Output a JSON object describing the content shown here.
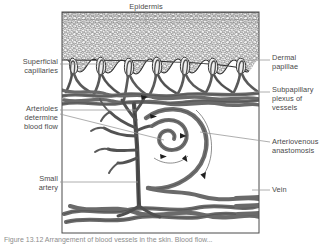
{
  "figure": {
    "title_label": "Epidermis",
    "frame": {
      "x": 62,
      "y": 12,
      "width": 197,
      "height": 221
    },
    "caption": "Figure 13.12  Arrangement of blood vessels in the skin. Blood flow..."
  },
  "labels": [
    {
      "id": "epidermis",
      "text": "Epidermis",
      "side": "top",
      "x": 108,
      "y": 2,
      "width": 76,
      "align": "center"
    },
    {
      "id": "superficial-capillaries",
      "text": "Superficial\ncapillaries",
      "side": "left",
      "x": 2,
      "y": 57,
      "width": 56,
      "align": "right"
    },
    {
      "id": "arterioles-determine-blood-flow",
      "text": "Arterioles\ndetermine\nblood flow",
      "side": "left",
      "x": 2,
      "y": 104,
      "width": 56,
      "align": "right"
    },
    {
      "id": "small-artery",
      "text": "Small\nartery",
      "side": "left",
      "x": 2,
      "y": 174,
      "width": 56,
      "align": "right"
    },
    {
      "id": "dermal-papillae",
      "text": "Dermal\npapillae",
      "side": "right",
      "x": 272,
      "y": 53,
      "width": 58,
      "align": "left"
    },
    {
      "id": "subpapillary-plexus-of-vessels",
      "text": "Subpapillary\nplexus of\nvessels",
      "side": "right",
      "x": 272,
      "y": 85,
      "width": 58,
      "align": "left"
    },
    {
      "id": "arteriovenous-anastomosis",
      "text": "Arteriovenous\nanastomosis",
      "side": "right",
      "x": 272,
      "y": 137,
      "width": 58,
      "align": "left"
    },
    {
      "id": "vein",
      "text": "Vein",
      "side": "right",
      "x": 272,
      "y": 185,
      "width": 58,
      "align": "left"
    }
  ],
  "colors": {
    "vessel_dark": "#6b6b6b",
    "vessel_outline": "#2e2e2e",
    "leader_line": "#9a9a9a",
    "frame": "#4a4a4a",
    "epidermis_fill": "#f2f2f2",
    "text": "#4a4a4a",
    "caption_text": "#8d8d8d"
  },
  "structures": {
    "epidermis_layer": "stippled-cellular-texture",
    "dermal_papillae_count": 7,
    "capillary_loops": "hairpin-loops-in-papillae",
    "subpapillary_plexus": "horizontal-anastomosing-network",
    "av_anastomosis": "coiled-spiral-shunt-with-flow-arrows",
    "deep_plexus": "horizontal-vessel-network-at-base",
    "flow_arrows": 6
  }
}
